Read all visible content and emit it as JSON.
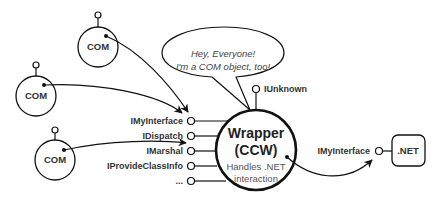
{
  "com_objects": [
    {
      "label": "COM"
    },
    {
      "label": "COM"
    },
    {
      "label": "COM"
    }
  ],
  "speech_bubble": {
    "line1": "Hey, Everyone!",
    "line2": "I'm a COM object, too!"
  },
  "wrapper": {
    "title_line1": "Wrapper",
    "title_line2": "(CCW)",
    "desc_line1": "Handles .NET",
    "desc_line2": "interaction",
    "top_interface": "IUnknown",
    "interfaces": [
      "IMyInterface",
      "IDispatch",
      "IMarshal",
      "IProvideClassInfo",
      "..."
    ]
  },
  "dotnet": {
    "label": ".NET",
    "interface": "IMyInterface"
  }
}
